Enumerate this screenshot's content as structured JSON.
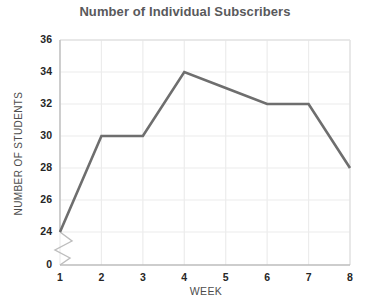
{
  "chart_data": {
    "type": "line",
    "title": "Number of Individual Subscribers",
    "xlabel": "WEEK",
    "ylabel": "NUMBER OF STUDENTS",
    "categories": [
      1,
      2,
      3,
      4,
      5,
      6,
      7,
      8
    ],
    "x_tick_labels": [
      "1",
      "2",
      "3",
      "4",
      "5",
      "6",
      "7",
      "8"
    ],
    "values": [
      24,
      30,
      30,
      34,
      33,
      32,
      32,
      28
    ],
    "series": [
      {
        "name": "Number of Individual Subscribers",
        "values": [
          24,
          30,
          30,
          34,
          33,
          32,
          32,
          28
        ]
      }
    ],
    "y_tick_labels": [
      "0",
      "24",
      "26",
      "28",
      "30",
      "32",
      "34",
      "36"
    ],
    "y_tick_values": [
      0,
      24,
      26,
      28,
      30,
      32,
      34,
      36
    ],
    "ylim": [
      24,
      36
    ],
    "xlim": [
      1,
      8
    ],
    "axis_break": true,
    "axis_break_between": [
      0,
      24
    ],
    "grid": true,
    "legend": "none",
    "line_color": "#6e6e6e",
    "grid_color": "#ececec",
    "title_color": "#59595b",
    "background_color": "#ffffff"
  }
}
